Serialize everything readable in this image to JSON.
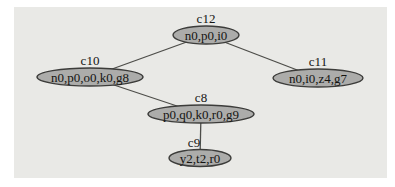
{
  "figure": {
    "kind": "cluster-graph-diagram",
    "panel": {
      "x": 14,
      "y": 7,
      "w": 373,
      "h": 171
    },
    "colors": {
      "page_background": "#ffffff",
      "panel_background": "#e9e9e6",
      "node_fill": "#acacaa",
      "node_stroke": "#3c3c3a",
      "edge": "#4d4d49",
      "text": "#141412"
    },
    "nodes": [
      {
        "id": "c12",
        "label": "c12",
        "text": "n0,p0,i0",
        "cx": 206,
        "cy": 35,
        "rx": 33,
        "ry": 9,
        "label_dx": 0
      },
      {
        "id": "c10",
        "label": "c10",
        "text": "n0,p0,o0,k0,g8",
        "cx": 90,
        "cy": 77,
        "rx": 53,
        "ry": 9,
        "label_dx": 0
      },
      {
        "id": "c11",
        "label": "c11",
        "text": "n0,i0,z4,g7",
        "cx": 318,
        "cy": 78,
        "rx": 45,
        "ry": 9,
        "label_dx": 0
      },
      {
        "id": "c8",
        "label": "c8",
        "text": "p0,q0,k0,r0,g9",
        "cx": 201,
        "cy": 114,
        "rx": 53,
        "ry": 9,
        "label_dx": 0
      },
      {
        "id": "c9",
        "label": "c9",
        "text": "y2,t2,r0",
        "cx": 200,
        "cy": 158,
        "rx": 31,
        "ry": 8.5,
        "label_dx": -6
      }
    ],
    "edges": [
      {
        "from": "c12",
        "to": "c10"
      },
      {
        "from": "c12",
        "to": "c11"
      },
      {
        "from": "c10",
        "to": "c8"
      },
      {
        "from": "c8",
        "to": "c9"
      }
    ]
  }
}
